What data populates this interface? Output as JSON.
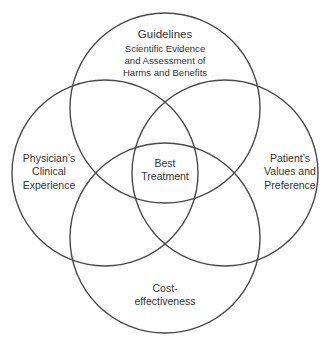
{
  "diagram": {
    "type": "venn",
    "stroke_color": "#4a4a4a",
    "circles": [
      {
        "id": "top",
        "title": "Guidelines",
        "lines": [
          "Scientific Evidence",
          "and Assessment of",
          "Harms and Benefits"
        ]
      },
      {
        "id": "left",
        "lines": [
          "Physician’s",
          "Clinical",
          "Experience"
        ]
      },
      {
        "id": "right",
        "lines": [
          "Patient’s",
          "Values and",
          "Preference"
        ]
      },
      {
        "id": "bottom",
        "lines": [
          "Cost-",
          "effectiveness"
        ]
      }
    ],
    "center": {
      "lines": [
        "Best",
        "Treatment"
      ]
    }
  }
}
